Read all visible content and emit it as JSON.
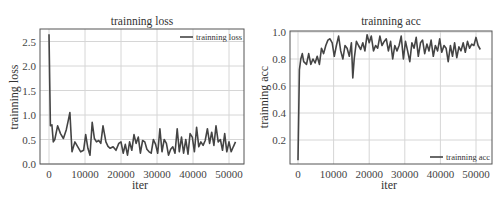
{
  "chart_data": [
    {
      "type": "line",
      "title": "trainning loss",
      "xlabel": "iter",
      "ylabel": "trainning loss",
      "xlim": [
        -3000,
        57000
      ],
      "ylim": [
        0.0,
        2.75
      ],
      "xticks": [
        0,
        10000,
        20000,
        30000,
        40000,
        50000
      ],
      "xtick_labels": [
        "0",
        "10000",
        "20000",
        "30000",
        "40000",
        "50000"
      ],
      "yticks": [
        0.0,
        0.5,
        1.0,
        1.5,
        2.0,
        2.5
      ],
      "ytick_labels": [
        "0.0",
        "0.5",
        "1.0",
        "1.5",
        "2.0",
        "2.5"
      ],
      "grid": true,
      "legend_position": "upper right",
      "series": [
        {
          "name": "trainning loss",
          "color": "#444444",
          "x": [
            0,
            400,
            800,
            1200,
            1600,
            2400,
            3200,
            4000,
            4800,
            5400,
            5800,
            6400,
            7200,
            8000,
            8800,
            9600,
            10200,
            10800,
            11400,
            12000,
            12600,
            13200,
            13800,
            14400,
            15000,
            15400,
            15800,
            16400,
            17000,
            17800,
            18600,
            19400,
            20000,
            20600,
            21200,
            21800,
            22400,
            23000,
            23600,
            24200,
            24800,
            25400,
            26000,
            26600,
            27200,
            27800,
            28400,
            29000,
            29600,
            30200,
            30800,
            31400,
            32000,
            32600,
            33200,
            33800,
            34400,
            35000,
            35600,
            36200,
            36800,
            37400,
            38000,
            38600,
            39200,
            39800,
            40400,
            41000,
            41600,
            42200,
            42800,
            43400,
            44000,
            44600,
            45200,
            45800,
            46400,
            47000,
            47600,
            48200,
            48800,
            49400,
            50000,
            50600,
            51200,
            51800
          ],
          "values": [
            2.65,
            0.78,
            0.8,
            0.45,
            0.5,
            0.78,
            0.62,
            0.52,
            0.7,
            0.9,
            1.05,
            0.25,
            0.45,
            0.35,
            0.25,
            0.28,
            0.6,
            0.32,
            0.18,
            0.85,
            0.52,
            0.45,
            0.48,
            0.42,
            0.78,
            0.62,
            0.45,
            0.36,
            0.32,
            0.35,
            0.28,
            0.42,
            0.45,
            0.22,
            0.4,
            0.18,
            0.45,
            0.28,
            0.6,
            0.42,
            0.55,
            0.22,
            0.48,
            0.45,
            0.3,
            0.25,
            0.22,
            0.5,
            0.4,
            0.22,
            0.72,
            0.25,
            0.5,
            0.42,
            0.18,
            0.3,
            0.35,
            0.22,
            0.72,
            0.25,
            0.55,
            0.22,
            0.5,
            0.2,
            0.62,
            0.55,
            0.25,
            0.75,
            0.35,
            0.45,
            0.38,
            0.48,
            0.72,
            0.42,
            0.65,
            0.38,
            0.78,
            0.45,
            0.5,
            0.28,
            0.62,
            0.25,
            0.45,
            0.25,
            0.35,
            0.45
          ]
        }
      ]
    },
    {
      "type": "line",
      "title": "trainning acc",
      "xlabel": "iter",
      "ylabel": "trainning acc",
      "xlim": [
        -3000,
        57000
      ],
      "ylim": [
        0.02,
        1.0
      ],
      "xticks": [
        0,
        10000,
        20000,
        30000,
        40000,
        50000
      ],
      "xtick_labels": [
        "0",
        "10000",
        "20000",
        "30000",
        "40000",
        "50000"
      ],
      "yticks": [
        0.2,
        0.4,
        0.6,
        0.8,
        1.0
      ],
      "ytick_labels": [
        "0.2",
        "0.4",
        "0.6",
        "0.8",
        "1.0"
      ],
      "grid": true,
      "legend_position": "lower right",
      "series": [
        {
          "name": "trainning acc",
          "color": "#444444",
          "x": [
            0,
            400,
            800,
            1200,
            1600,
            2400,
            3000,
            3600,
            4200,
            4800,
            5400,
            6000,
            6600,
            7200,
            7800,
            8400,
            9000,
            9600,
            10200,
            10800,
            11400,
            12000,
            12600,
            13200,
            13800,
            14400,
            15000,
            15400,
            15800,
            16400,
            17000,
            17600,
            18200,
            18800,
            19400,
            20000,
            20600,
            21200,
            21800,
            22400,
            23000,
            23600,
            24200,
            24800,
            25400,
            26000,
            26600,
            27200,
            27800,
            28400,
            29000,
            29600,
            30200,
            30800,
            31400,
            32000,
            32600,
            33200,
            33800,
            34400,
            35000,
            35600,
            36200,
            36800,
            37400,
            38000,
            38600,
            39200,
            39800,
            40400,
            41000,
            41600,
            42200,
            42800,
            43400,
            44000,
            44600,
            45200,
            45800,
            46400,
            47000,
            47600,
            48200,
            48800,
            49400,
            50000,
            50600,
            51200,
            51800
          ],
          "values": [
            0.05,
            0.72,
            0.8,
            0.84,
            0.78,
            0.76,
            0.84,
            0.76,
            0.8,
            0.77,
            0.82,
            0.76,
            0.88,
            0.84,
            0.9,
            0.94,
            0.95,
            0.92,
            0.82,
            0.9,
            0.97,
            0.86,
            0.8,
            0.9,
            0.88,
            0.82,
            0.92,
            0.66,
            0.8,
            0.93,
            0.9,
            0.87,
            0.92,
            0.86,
            0.98,
            0.92,
            0.97,
            0.86,
            0.9,
            0.88,
            0.97,
            0.9,
            0.93,
            0.95,
            0.86,
            0.93,
            0.8,
            0.9,
            0.86,
            0.9,
            0.97,
            0.8,
            0.93,
            0.86,
            0.78,
            0.92,
            0.88,
            0.96,
            0.82,
            0.92,
            0.94,
            0.84,
            0.91,
            0.86,
            0.94,
            0.82,
            0.9,
            0.86,
            0.95,
            0.85,
            0.9,
            0.88,
            0.78,
            0.9,
            0.82,
            0.92,
            0.81,
            0.89,
            0.86,
            0.92,
            0.85,
            0.93,
            0.88,
            0.91,
            0.9,
            0.96,
            0.9,
            0.87
          ],
          "legend_label": "trainning acc"
        }
      ]
    }
  ]
}
